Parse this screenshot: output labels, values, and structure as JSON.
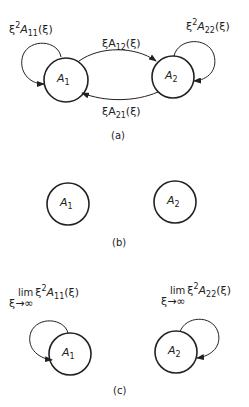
{
  "panels": [
    {
      "caption": "(a)",
      "nodes": [
        {
          "label": "A",
          "sub": "1"
        },
        {
          "label": "A",
          "sub": "2"
        }
      ],
      "edges": {
        "self_1": {
          "pre": "ξ",
          "sup": "2",
          "mid": "A",
          "sub": "11",
          "post": "(ξ)"
        },
        "self_2": {
          "pre": "ξ",
          "sup": "2",
          "mid": "A",
          "sub": "22",
          "post": "(ξ)"
        },
        "e12": {
          "pre": "ξA",
          "sub": "12",
          "post": "(ξ)"
        },
        "e21": {
          "pre": "ξA",
          "sub": "21",
          "post": "(ξ)"
        }
      }
    },
    {
      "caption": "(b)",
      "nodes": [
        {
          "label": "A",
          "sub": "1"
        },
        {
          "label": "A",
          "sub": "2"
        }
      ]
    },
    {
      "caption": "(c)",
      "nodes": [
        {
          "label": "A",
          "sub": "1"
        },
        {
          "label": "A",
          "sub": "2"
        }
      ],
      "edges": {
        "self_1": {
          "lim": "lim",
          "under": "ξ→∞",
          "pre": "ξ",
          "sup": "2",
          "mid": "A",
          "sub": "11",
          "post": "(ξ)"
        },
        "self_2": {
          "lim": "lim",
          "under": "ξ→∞",
          "pre": "ξ",
          "sup": "2",
          "mid": "A",
          "sub": "22",
          "post": "(ξ)"
        }
      }
    }
  ]
}
